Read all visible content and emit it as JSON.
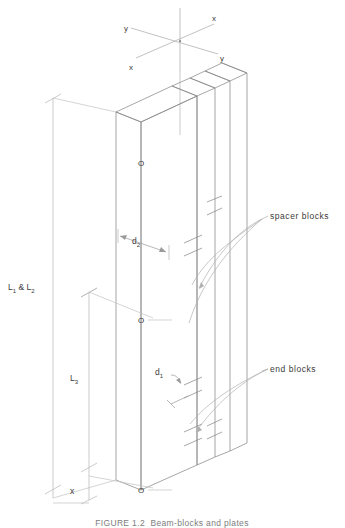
{
  "figure": {
    "domain": "engineering-isometric-drawing",
    "caption": "FIGURE 1.2  Beam-blocks and plates",
    "axes": {
      "label_x_upper": "x",
      "label_x_lower": "x",
      "label_y_upper": "y",
      "label_y_lower": "y"
    },
    "dimensions": [
      {
        "id": "L12",
        "base": "L",
        "sub": "1",
        "joiner": " & ",
        "base2": "L",
        "sub2": "2",
        "text": "L₁ & L₂"
      },
      {
        "id": "L3",
        "base": "L",
        "sub": "3",
        "text": "L₃"
      },
      {
        "id": "x",
        "base": "x",
        "sub": "",
        "text": "x"
      },
      {
        "id": "d1",
        "base": "d",
        "sub": "1",
        "text": "d₁"
      },
      {
        "id": "d2",
        "base": "d",
        "sub": "2",
        "text": "d₂"
      }
    ],
    "annotations": [
      {
        "id": "spacer-blocks",
        "text": "spacer blocks"
      },
      {
        "id": "end-blocks",
        "text": "end blocks"
      }
    ],
    "center_markers": [
      {
        "id": "o-top",
        "text": "O"
      },
      {
        "id": "o-middle",
        "text": "O"
      },
      {
        "id": "o-bottom",
        "text": "O"
      }
    ],
    "colors": {
      "line": "#8a8a8a",
      "line_light": "#b5b5b5",
      "line_dark": "#6e6e6e",
      "text": "#3b3b3b",
      "caption": "#7d7d7d",
      "background": "#ffffff"
    }
  }
}
